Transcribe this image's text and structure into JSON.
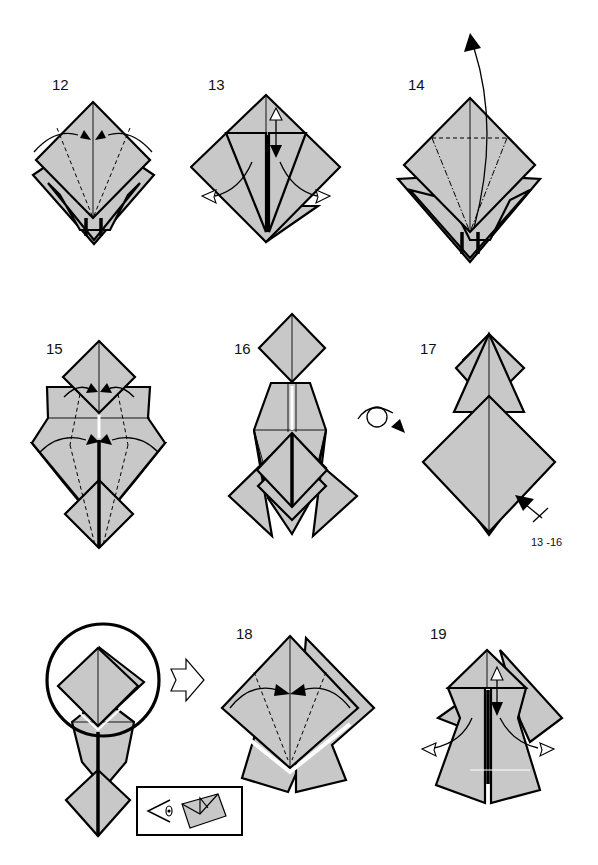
{
  "page": {
    "background": "#ffffff",
    "paper_color": "#c8c8c8",
    "line_color": "#000000"
  },
  "steps": [
    {
      "number": "12",
      "instruction_symbols": [
        "valley-fold-lines",
        "fold-in-arrows"
      ]
    },
    {
      "number": "13",
      "instruction_symbols": [
        "valley-fold-line",
        "fold-unfold-arrow",
        "open-arrows"
      ]
    },
    {
      "number": "14",
      "instruction_symbols": [
        "valley-fold-line",
        "mountain-fold-lines",
        "petal-fold-arrow"
      ]
    },
    {
      "number": "15",
      "instruction_symbols": [
        "valley-fold-lines",
        "fold-in-arrows"
      ]
    },
    {
      "number": "16",
      "instruction_symbols": [
        "turn-over-arrow"
      ]
    },
    {
      "number": "17",
      "instruction_symbols": [
        "repeat-arrow"
      ],
      "annotation": "13 -16"
    },
    {
      "number": "",
      "instruction_symbols": [
        "focus-circle",
        "next-view-arrow",
        "view-inset"
      ]
    },
    {
      "number": "18",
      "instruction_symbols": [
        "valley-fold-lines",
        "fold-in-arrows"
      ]
    },
    {
      "number": "19",
      "instruction_symbols": [
        "valley-fold-line",
        "fold-unfold-arrow",
        "open-arrows"
      ]
    }
  ]
}
